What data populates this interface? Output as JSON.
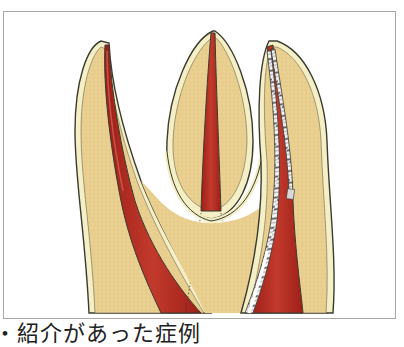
{
  "figure": {
    "colors": {
      "dentin": "#e9cf8f",
      "dentin_shade": "#dcbc77",
      "cementum": "#f4efc4",
      "outline": "#3b3b32",
      "pulp_canal": "#b52a22",
      "pulp_highlight": "#d06a5a",
      "file_steel": "#f2f2f2",
      "file_shadow": "#6a6a72",
      "frame_border": "#a8a8a8"
    },
    "roots": [
      {
        "name": "left-root",
        "canal": "narrow canal widening toward apex-bottom"
      },
      {
        "name": "center-root",
        "canal": "straight tapered canal"
      },
      {
        "name": "right-root",
        "canal": "canal with two endodontic files inserted"
      }
    ],
    "instruments": [
      {
        "name": "endodontic-file-1"
      },
      {
        "name": "endodontic-file-2"
      }
    ]
  },
  "caption": {
    "text": "・紹介があった症例"
  }
}
